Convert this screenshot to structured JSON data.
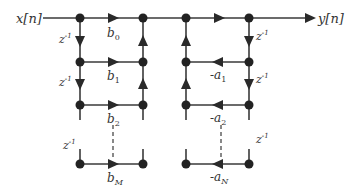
{
  "diagram": {
    "input_label": "x[n]",
    "output_label": "y[n]",
    "delay_label": "z",
    "delay_exp": "-1",
    "feedforward": [
      {
        "base": "b",
        "sub": "0"
      },
      {
        "base": "b",
        "sub": "1"
      },
      {
        "base": "b",
        "sub": "2"
      },
      {
        "base": "b",
        "sub": "M"
      }
    ],
    "feedback": [
      {
        "base": "-a",
        "sub": "1"
      },
      {
        "base": "-a",
        "sub": "2"
      },
      {
        "base": "-a",
        "sub": "N"
      }
    ],
    "colors": {
      "line": "#3a3a3a",
      "text": "#333333"
    }
  }
}
